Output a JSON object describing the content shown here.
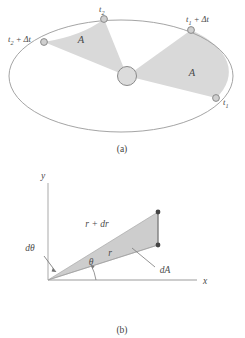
{
  "figure": {
    "panels": [
      {
        "id": "a",
        "caption": "(a)",
        "description": "Elliptical orbit with two equal swept areas",
        "area_labels": [
          {
            "name": "area-left",
            "text": "A"
          },
          {
            "name": "area-right",
            "text": "A"
          }
        ],
        "point_labels": [
          {
            "name": "t2-plus-dt",
            "base": "t",
            "sub": "2",
            "rest": " + Δt"
          },
          {
            "name": "t2",
            "base": "t",
            "sub": "2",
            "rest": ""
          },
          {
            "name": "t1-plus-dt",
            "base": "t",
            "sub": "1",
            "rest": " + Δt"
          },
          {
            "name": "t1",
            "base": "t",
            "sub": "1",
            "rest": ""
          }
        ],
        "central_body": "sun"
      },
      {
        "id": "b",
        "caption": "(b)",
        "description": "Differential area element dA swept by radius r through angle dtheta",
        "axis_labels": {
          "x": "x",
          "y": "y"
        },
        "labels": [
          {
            "name": "r-plus-dr-label",
            "text": "r + dr"
          },
          {
            "name": "r-label",
            "text": "r"
          },
          {
            "name": "d-theta-label",
            "text": "dθ"
          },
          {
            "name": "theta-label",
            "text": "θ"
          },
          {
            "name": "dA-label",
            "text": "dA"
          }
        ]
      }
    ]
  },
  "colors": {
    "background": "#ffffff",
    "outline": "#8c8c8c",
    "fill_sector": "#d9d9d9",
    "marker_fill": "#cfcfcf",
    "marker_stroke": "#8a8a8a",
    "text": "#4a4a4a",
    "axis": "#b9b9b9",
    "dot_fill": "#4a4a4a"
  }
}
